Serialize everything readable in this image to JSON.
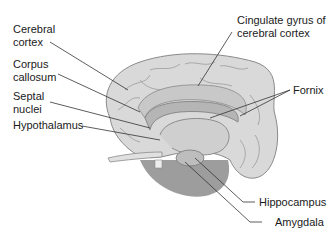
{
  "diagram": {
    "labels": {
      "cerebral_cortex": "Cerebral\ncortex",
      "corpus_callosum": "Corpus\ncallosum",
      "septal_nuclei": "Septal\nnuclei",
      "hypothalamus": "Hypothalamus",
      "cingulate_gyrus": "Cingulate gyrus of\ncerebral cortex",
      "fornix": "Fornix",
      "hippocampus": "Hippocampus",
      "amygdala": "Amygdala"
    },
    "colors": {
      "background": "#ffffff",
      "cortex": "#d9d9d9",
      "cortex_dark": "#9a9a9a",
      "limbic_shade": "#b5b5b5",
      "cerebellum": "#8c8c8c",
      "leader_line": "#333333",
      "text": "#1a1a1a"
    }
  }
}
